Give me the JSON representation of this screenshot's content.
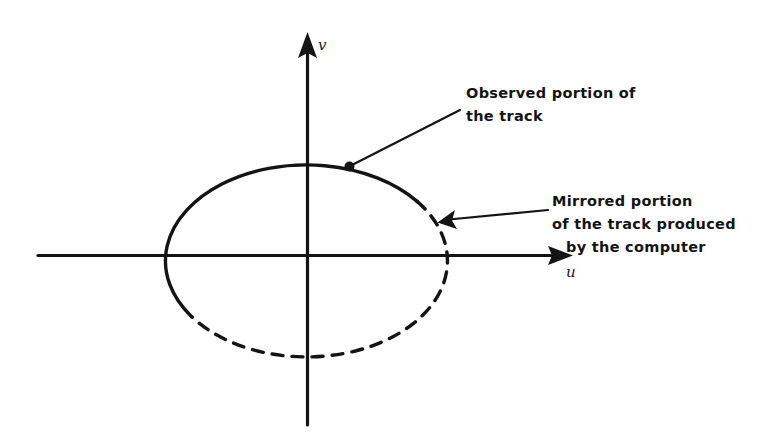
{
  "figure": {
    "kind": "line-diagram",
    "background_color": "#ffffff",
    "ink_color": "#141414",
    "axes": {
      "horizontal": {
        "name": "u",
        "label": "u",
        "arrow": "right",
        "x_start": 38,
        "x_end": 573,
        "y": 255
      },
      "vertical": {
        "name": "v",
        "label": "v",
        "arrow": "up",
        "y_start": 425,
        "y_end": 32,
        "x": 307
      }
    },
    "track": {
      "shape": "ellipse",
      "center_x": 304,
      "center_y": 259,
      "radius_x": 141,
      "radius_y": 96,
      "observed_segment": {
        "style": "solid",
        "start_angle_deg": 143,
        "end_angle_deg": 338
      },
      "mirrored_segment": {
        "style": "dashed",
        "start_angle_deg": 338,
        "end_angle_deg": 143,
        "dash_pattern": "11 9"
      }
    },
    "callouts": [
      {
        "id": "observed",
        "lines": [
          "Observed portion of",
          "the track"
        ],
        "text_x": 466,
        "text_y": 97,
        "leader_from_x": 460,
        "leader_from_y": 110,
        "leader_to_x": 350,
        "leader_to_y": 166,
        "marker": "dot"
      },
      {
        "id": "mirrored",
        "lines": [
          "Mirrored portion",
          "of the track produced",
          "by the computer"
        ],
        "text_x": 552,
        "text_y": 205,
        "leader_from_x": 548,
        "leader_from_y": 210,
        "leader_to_x": 441,
        "leader_to_y": 222,
        "marker": "arrowhead"
      }
    ]
  }
}
